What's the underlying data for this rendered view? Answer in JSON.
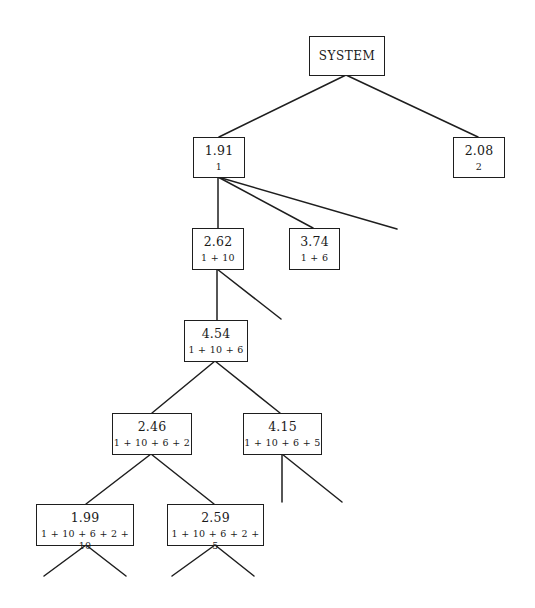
{
  "diagram": {
    "type": "tree",
    "root": {
      "label": "SYSTEM"
    },
    "nodes": [
      {
        "id": "n191",
        "value": "1.91",
        "path": "1"
      },
      {
        "id": "n208",
        "value": "2.08",
        "path": "2"
      },
      {
        "id": "n262",
        "value": "2.62",
        "path": "1+10"
      },
      {
        "id": "n374",
        "value": "3.74",
        "path": "1+6"
      },
      {
        "id": "n454",
        "value": "4.54",
        "path": "1+10+6"
      },
      {
        "id": "n246",
        "value": "2.46",
        "path": "1+10+6+2"
      },
      {
        "id": "n415",
        "value": "4.15",
        "path": "1+10+6+5"
      },
      {
        "id": "n199",
        "value": "1.99",
        "path": "1+10+6+2+10"
      },
      {
        "id": "n259",
        "value": "2.59",
        "path": "1+10+6+2+5"
      }
    ],
    "edges": [
      [
        "SYSTEM",
        "1.91"
      ],
      [
        "SYSTEM",
        "2.08"
      ],
      [
        "1.91",
        "2.62"
      ],
      [
        "1.91",
        "3.74"
      ],
      [
        "1.91",
        "(unexpanded)"
      ],
      [
        "2.62",
        "4.54"
      ],
      [
        "2.62",
        "(unexpanded)"
      ],
      [
        "4.54",
        "2.46"
      ],
      [
        "4.54",
        "4.15"
      ],
      [
        "2.46",
        "1.99"
      ],
      [
        "2.46",
        "2.59"
      ],
      [
        "4.15",
        "(unexpanded)"
      ],
      [
        "4.15",
        "(unexpanded)"
      ],
      [
        "1.99",
        "(unexpanded)"
      ],
      [
        "1.99",
        "(unexpanded)"
      ],
      [
        "2.59",
        "(unexpanded)"
      ],
      [
        "2.59",
        "(unexpanded)"
      ]
    ],
    "colors": {
      "line": "#1e1e1e",
      "background": "#ffffff",
      "text": "#1a1a1a"
    }
  }
}
